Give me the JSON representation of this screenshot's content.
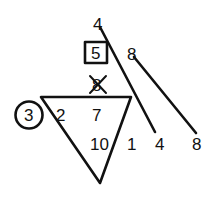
{
  "diagram": {
    "type": "math-puzzle-sketch",
    "colors": {
      "ink": "#111111",
      "background": "#ffffff"
    },
    "triangle": {
      "shape": "inverted-triangle",
      "vertices": [
        [
          41,
          97
        ],
        [
          131,
          97
        ],
        [
          100,
          183
        ]
      ],
      "inside_numbers": {
        "top_left": "2",
        "top_center": "7",
        "bottom_center": "10"
      },
      "outside_right": "1"
    },
    "circled_number": "3",
    "boxed_number": "5",
    "crossed_out_number": "8",
    "diagonal_lines": [
      {
        "start_label": "4",
        "end_label": "4",
        "from": [
          100,
          28
        ],
        "to": [
          154,
          131
        ]
      },
      {
        "start_label": "8",
        "end_label": "8",
        "from": [
          135,
          58
        ],
        "to": [
          195,
          132
        ]
      }
    ]
  }
}
